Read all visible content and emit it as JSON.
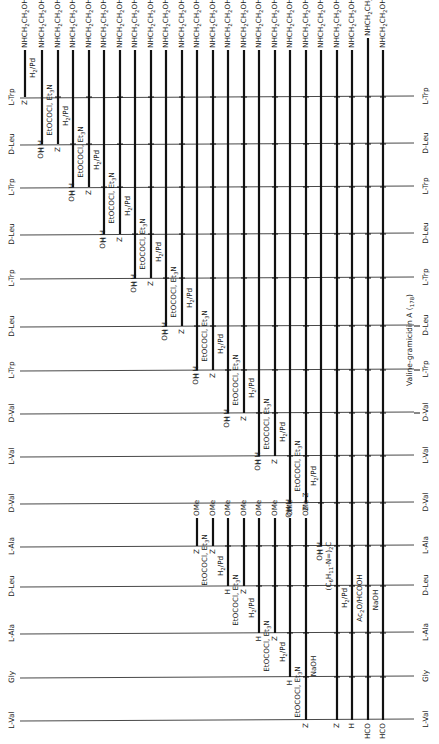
{
  "diagram": {
    "title": "Valine-gramicidin A (178)",
    "title_pointer_rows": [
      "L-Trp",
      "D-Leu",
      "L-Trp",
      "D-Val"
    ],
    "colors": {
      "line": "#111111",
      "row_line": "#333333",
      "background": "#ffffff"
    },
    "rows": [
      {
        "label": "L-Trp",
        "y": 97
      },
      {
        "label": "D-Leu",
        "y": 144
      },
      {
        "label": "L-Trp",
        "y": 187
      },
      {
        "label": "D-Leu",
        "y": 234
      },
      {
        "label": "L-Trp",
        "y": 278
      },
      {
        "label": "D-Leu",
        "y": 326
      },
      {
        "label": "L-Trp",
        "y": 370
      },
      {
        "label": "D-Val",
        "y": 413
      },
      {
        "label": "L-Val",
        "y": 456
      },
      {
        "label": "D-Val",
        "y": 503
      },
      {
        "label": "L-Ala",
        "y": 546
      },
      {
        "label": "D-Leu",
        "y": 586
      },
      {
        "label": "L-Ala",
        "y": 633
      },
      {
        "label": "Gly",
        "y": 677
      },
      {
        "label": "L-Val",
        "y": 720
      }
    ],
    "columns": [
      {
        "x": 25,
        "top_label": "NHCH2CH2OH",
        "y_top": 50,
        "y_bottom": 97,
        "bottom_label": "Z",
        "reagent": "H2/Pd",
        "reagent_y": 68,
        "junctions": []
      },
      {
        "x": 42,
        "top_label": "NHCH2CH2OH",
        "y_top": 50,
        "y_bottom": 144,
        "bottom_label": "H",
        "reagent": "EtOCOCl, Et3N",
        "reagent_y": 110,
        "left_label": "OH",
        "left_label_y": 144,
        "junctions": []
      },
      {
        "x": 58,
        "top_label": "NHCH2CH2OH",
        "y_top": 50,
        "y_bottom": 144,
        "bottom_label": "Z",
        "reagent": "H2/Pd",
        "reagent_y": 116,
        "junctions": [
          97
        ]
      },
      {
        "x": 73,
        "top_label": "NHCH2CH2OH",
        "y_top": 50,
        "y_bottom": 187,
        "bottom_label": "H",
        "reagent": "EtOCOCl, Et3N",
        "reagent_y": 152,
        "left_label": "OH",
        "left_label_y": 187,
        "junctions": [
          144
        ]
      },
      {
        "x": 89,
        "top_label": "NHCH2CH2OH",
        "y_top": 50,
        "y_bottom": 187,
        "bottom_label": "Z",
        "reagent": "H2/Pd",
        "reagent_y": 160,
        "junctions": [
          97,
          144
        ]
      },
      {
        "x": 104,
        "top_label": "NHCH2CH2OH",
        "y_top": 50,
        "y_bottom": 234,
        "bottom_label": "H",
        "reagent": "EtOCOCl, Et3N",
        "reagent_y": 198,
        "left_label": "OH",
        "left_label_y": 234,
        "junctions": [
          187
        ]
      },
      {
        "x": 120,
        "top_label": "NHCH2CH2OH",
        "y_top": 50,
        "y_bottom": 234,
        "bottom_label": "Z",
        "reagent": "H2/Pd",
        "reagent_y": 206,
        "junctions": [
          97,
          144,
          187
        ]
      },
      {
        "x": 135,
        "top_label": "NHCH2CH2OH",
        "y_top": 50,
        "y_bottom": 278,
        "bottom_label": "H",
        "reagent": "EtOCOCl, Et3N",
        "reagent_y": 244,
        "left_label": "OH",
        "left_label_y": 278,
        "junctions": [
          234
        ]
      },
      {
        "x": 151,
        "top_label": "NHCH2CH2OH",
        "y_top": 50,
        "y_bottom": 278,
        "bottom_label": "Z",
        "reagent": "H2/Pd",
        "reagent_y": 252,
        "junctions": [
          97,
          144,
          187,
          234
        ]
      },
      {
        "x": 166,
        "top_label": "NHCH2CH2OH",
        "y_top": 50,
        "y_bottom": 326,
        "bottom_label": "H",
        "reagent": "EtOCOCl, Et3N",
        "reagent_y": 292,
        "left_label": "OH",
        "left_label_y": 326,
        "junctions": [
          278
        ]
      },
      {
        "x": 182,
        "top_label": "NHCH2CH2OH",
        "y_top": 50,
        "y_bottom": 326,
        "bottom_label": "Z",
        "reagent": "H2/Pd",
        "reagent_y": 298,
        "junctions": [
          97,
          144,
          187,
          234,
          278
        ]
      },
      {
        "x": 197,
        "top_label": "NHCH2CH2OH",
        "y_top": 50,
        "y_bottom": 370,
        "bottom_label": "H",
        "reagent": "EtOCOCl, Et3N",
        "reagent_y": 336,
        "left_label": "OH",
        "left_label_y": 370,
        "junctions": [
          326
        ]
      },
      {
        "x": 213,
        "top_label": "NHCH2CH2OH",
        "y_top": 50,
        "y_bottom": 370,
        "bottom_label": "Z",
        "reagent": "H2/Pd",
        "reagent_y": 344,
        "junctions": [
          97,
          144,
          187,
          234,
          278,
          326
        ]
      },
      {
        "x": 228,
        "top_label": "NHCH2CH2OH",
        "y_top": 50,
        "y_bottom": 413,
        "bottom_label": "H",
        "reagent": "EtOCOCl, Et3N",
        "reagent_y": 380,
        "left_label": "OH",
        "left_label_y": 413,
        "junctions": [
          370
        ]
      },
      {
        "x": 244,
        "top_label": "NHCH2CH2OH",
        "y_top": 50,
        "y_bottom": 413,
        "bottom_label": "Z",
        "reagent": "H2/Pd",
        "reagent_y": 388,
        "junctions": [
          97,
          144,
          187,
          234,
          278,
          326,
          370
        ]
      },
      {
        "x": 259,
        "top_label": "NHCH2CH2OH",
        "y_top": 50,
        "y_bottom": 456,
        "bottom_label": "H",
        "reagent": "EtOCOCl, Et3N",
        "reagent_y": 424,
        "left_label": "OH",
        "left_label_y": 456,
        "junctions": [
          413
        ]
      },
      {
        "x": 275,
        "top_label": "NHCH2CH2OH",
        "y_top": 50,
        "y_bottom": 456,
        "bottom_label": "Z",
        "reagent": "H2/Pd",
        "reagent_y": 432,
        "junctions": [
          97,
          144,
          187,
          234,
          278,
          326,
          370,
          413
        ]
      },
      {
        "x": 290,
        "top_label": "NHCH2CH2OH",
        "y_top": 50,
        "y_bottom": 503,
        "bottom_label": "H",
        "reagent": "EtOCOCl, Et3N",
        "reagent_y": 466,
        "left_label": "OH",
        "left_label_y": 503,
        "junctions": [
          456
        ]
      },
      {
        "x": 306,
        "top_label": "NHCH2CH2OH",
        "y_top": 50,
        "y_bottom": 503,
        "bottom_label": "Z",
        "reagent": "H2/Pd",
        "reagent_y": 476,
        "junctions": [
          97,
          144,
          187,
          234,
          278,
          326,
          370,
          413,
          456
        ]
      },
      {
        "x": 321,
        "top_label": "NHCH2CH2OH",
        "y_top": 50,
        "y_bottom": 546,
        "bottom_label": "H",
        "reagent": "(C6H11-N=)2C",
        "reagent_y": 566,
        "left_label": "OH",
        "left_label_y": 546,
        "junctions": [
          503
        ]
      },
      {
        "x": 337,
        "top_label": "NHCH2CH2OH",
        "y_top": 50,
        "y_bottom": 720,
        "bottom_label": "Z",
        "reagent": "H2/Pd",
        "reagent_y": 598,
        "junctions": [
          97,
          144,
          187,
          234,
          278,
          326,
          370,
          413,
          456,
          503,
          546,
          586,
          633,
          677
        ]
      },
      {
        "x": 352,
        "top_label": "NHCH2CH2OH",
        "y_top": 50,
        "y_bottom": 720,
        "bottom_label": "H",
        "reagent": "Ac2O/HCOOH",
        "reagent_y": 598,
        "junctions": [
          97,
          144,
          187,
          234,
          278,
          326,
          370,
          413,
          456,
          503,
          546,
          586,
          633,
          677
        ]
      },
      {
        "x": 368,
        "top_label": "NHCH2CH2OCHO",
        "y_top": 38,
        "y_bottom": 720,
        "bottom_label": "HCO",
        "reagent": "NaOH",
        "reagent_y": 600,
        "junctions": [
          97,
          144,
          187,
          234,
          278,
          326,
          370,
          413,
          456,
          503,
          546,
          586,
          633,
          677
        ]
      },
      {
        "x": 383,
        "top_label": "NHCH2CH2OH",
        "y_top": 50,
        "y_bottom": 720,
        "bottom_label": "HCO",
        "reagent": "",
        "reagent_y": 0,
        "junctions": [
          97,
          144,
          187,
          234,
          278,
          326,
          370,
          413,
          456,
          503,
          546,
          586,
          633,
          677
        ]
      }
    ],
    "ome_columns": [
      {
        "x": 197,
        "y_top": 518,
        "y_bottom": 546,
        "top_label": "OMe",
        "bottom_label": "Z",
        "left_label": "OH",
        "left_label_y": 546,
        "reagent": "EtOCOCl, Et3N",
        "reagent_y": 560,
        "junctions": []
      },
      {
        "x": 213,
        "y_top": 518,
        "y_bottom": 546,
        "top_label": "OMe",
        "bottom_label": "Z",
        "reagent": "H2/Pd",
        "reagent_y": 566,
        "junctions": []
      },
      {
        "x": 228,
        "y_top": 518,
        "y_bottom": 586,
        "top_label": "OMe",
        "bottom_label": "H",
        "reagent": "EtOCOCl, Et3N",
        "reagent_y": 600,
        "left_label": "OH",
        "left_label_y": 586,
        "junctions": [
          546
        ]
      },
      {
        "x": 244,
        "y_top": 518,
        "y_bottom": 586,
        "top_label": "OMe",
        "bottom_label": "Z",
        "reagent": "H2/Pd",
        "reagent_y": 608,
        "junctions": [
          546
        ]
      },
      {
        "x": 259,
        "y_top": 518,
        "y_bottom": 633,
        "top_label": "OMe",
        "bottom_label": "H",
        "reagent": "EtOCOCl, Et3N",
        "reagent_y": 646,
        "left_label": "OH",
        "left_label_y": 633,
        "junctions": [
          546,
          586
        ]
      },
      {
        "x": 275,
        "y_top": 518,
        "y_bottom": 633,
        "top_label": "OMe",
        "bottom_label": "Z",
        "reagent": "H2/Pd",
        "reagent_y": 652,
        "junctions": [
          546,
          586
        ]
      },
      {
        "x": 290,
        "y_top": 518,
        "y_bottom": 677,
        "top_label": "OMe",
        "bottom_label": "H",
        "reagent": "EtOCOCl, Et3N",
        "reagent_y": 692,
        "left_label": "OH",
        "left_label_y": 677,
        "junctions": [
          546,
          586,
          633
        ]
      },
      {
        "x": 306,
        "y_top": 518,
        "y_bottom": 720,
        "top_label": "OMe Z",
        "bottom_label": "Z",
        "reagent": "NaOH",
        "reagent_y": 666,
        "junctions": [
          546,
          586,
          633,
          677
        ]
      }
    ],
    "top_reagent_note": "OH H"
  }
}
